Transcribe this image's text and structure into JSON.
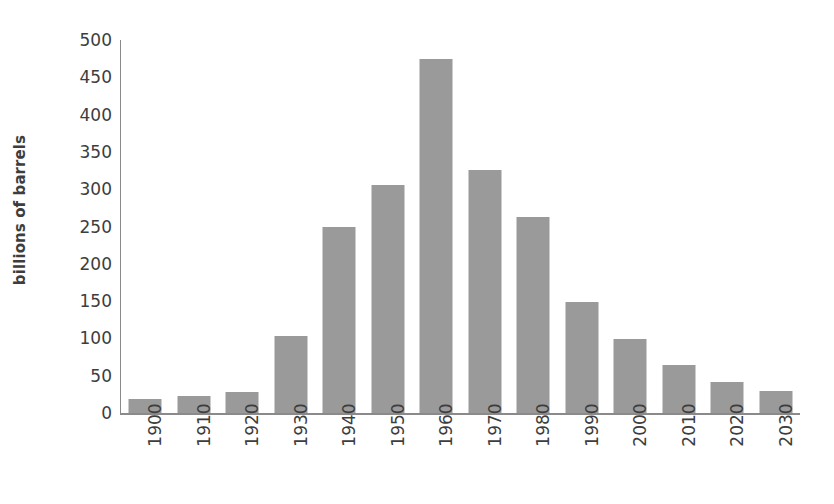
{
  "chart_data": {
    "type": "bar",
    "title": "",
    "xlabel": "",
    "ylabel": "billions of barrels",
    "categories": [
      "1900",
      "1910",
      "1920",
      "1930",
      "1940",
      "1950",
      "1960",
      "1970",
      "1980",
      "1990",
      "2000",
      "2010",
      "2020",
      "2030"
    ],
    "values": [
      19,
      23,
      28,
      103,
      249,
      305,
      474,
      326,
      263,
      149,
      99,
      64,
      42,
      30
    ],
    "ylim": [
      0,
      500
    ],
    "yticks": [
      0,
      50,
      100,
      150,
      200,
      250,
      300,
      350,
      400,
      450,
      500
    ],
    "ytick_labels": [
      "0",
      "50",
      "100",
      "150",
      "200",
      "250",
      "300",
      "350",
      "400",
      "450",
      "500"
    ],
    "grid": false,
    "legend": null,
    "series": [
      {
        "name": "billions of barrels",
        "color": "#9a9a9a",
        "values": [
          19,
          23,
          28,
          103,
          249,
          305,
          474,
          326,
          263,
          149,
          99,
          64,
          42,
          30
        ]
      }
    ],
    "colors": {
      "bar": "#9a9a9a",
      "axis": "#8a8a8a",
      "text": "#3d3d3d",
      "background": "#ffffff"
    }
  }
}
